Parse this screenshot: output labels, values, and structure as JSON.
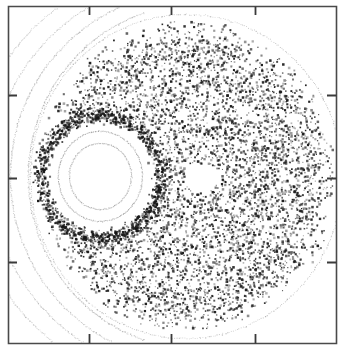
{
  "figure": {
    "title": "",
    "background_color": "#ffffff",
    "width": 346,
    "height": 352
  },
  "chart_data": {
    "type": "scatter",
    "title": "",
    "subtitle": "",
    "xlabel": "",
    "ylabel": "",
    "xlim": [
      0,
      1
    ],
    "ylim": [
      0,
      1
    ],
    "grid": false,
    "legend": null,
    "annotations": [],
    "axes": {
      "frame": {
        "x0": 8,
        "y0": 6,
        "x1": 336,
        "y1": 343,
        "color": "#4a4a4a",
        "line_width": 1.6
      },
      "tick_direction": "in",
      "tick_length": 9,
      "tick_color": "#3a3a3a",
      "tick_line_width": 1.8,
      "ticks_top_x": [
        89,
        171,
        255
      ],
      "ticks_bottom_x": [
        89,
        171,
        255
      ],
      "ticks_left_y": [
        95,
        178,
        262
      ],
      "ticks_right_y": [
        95,
        178,
        262
      ],
      "tick_labels_top": [],
      "tick_labels_bottom": [],
      "tick_labels_left": [],
      "tick_labels_right": []
    },
    "series": [
      {
        "name": "chaotic-sea",
        "kind": "scatter-cloud",
        "point_count": 5200,
        "marker": "square",
        "marker_size": [
          1,
          2.6
        ],
        "color": "#1d1d1d",
        "opacity_range": [
          0.28,
          1.0
        ],
        "region": {
          "shape": "ellipse-minus-island",
          "center": [
            186,
            176
          ],
          "radius_x": 152,
          "radius_y": 158,
          "exclude_island": {
            "center": [
              100,
              176
            ],
            "radius_x": 53,
            "radius_y": 55
          },
          "exclude_void": {
            "center": [
              201,
              177
            ],
            "radius_x": 17,
            "radius_y": 14
          }
        }
      },
      {
        "name": "island-separatrix-halo",
        "kind": "scatter-ring",
        "point_count": 900,
        "color": "#151515",
        "ring": {
          "center": [
            100,
            176
          ],
          "radius_x": 60,
          "radius_y": 62,
          "thickness": 14
        }
      },
      {
        "name": "invariant-circle-outer",
        "kind": "dotted-curve",
        "dot_count": 300,
        "color": "#8a8a8a",
        "ellipse": {
          "center": [
            100,
            176
          ],
          "radius_x": 42,
          "radius_y": 45,
          "rotation": 0
        }
      },
      {
        "name": "invariant-circle-inner",
        "kind": "dotted-curve",
        "dot_count": 260,
        "color": "#9a9a9a",
        "ellipse": {
          "center": [
            100,
            176
          ],
          "radius_x": 31,
          "radius_y": 33,
          "rotation": 0
        }
      },
      {
        "name": "outer-kam-torus-1",
        "kind": "dotted-arc",
        "dot_count": 400,
        "color": "#9e9e9e",
        "ellipse": {
          "center": [
            196,
            176
          ],
          "radius_x": 168,
          "radius_y": 172
        },
        "angle_range_deg": [
          108,
          252
        ]
      },
      {
        "name": "outer-kam-torus-2",
        "kind": "dotted-arc",
        "dot_count": 420,
        "color": "#a6a6a6",
        "ellipse": {
          "center": [
            196,
            176
          ],
          "radius_x": 186,
          "radius_y": 186
        },
        "angle_range_deg": [
          104,
          256
        ]
      },
      {
        "name": "outer-kam-torus-3",
        "kind": "dotted-arc",
        "dot_count": 440,
        "color": "#acacac",
        "ellipse": {
          "center": [
            196,
            176
          ],
          "radius_x": 205,
          "radius_y": 199
        },
        "angle_range_deg": [
          100,
          260
        ]
      },
      {
        "name": "outer-kam-torus-4",
        "kind": "dotted-arc",
        "dot_count": 460,
        "color": "#b4b4b4",
        "ellipse": {
          "center": [
            196,
            176
          ],
          "radius_x": 226,
          "radius_y": 214
        },
        "angle_range_deg": [
          98,
          262
        ]
      },
      {
        "name": "boundary-torus",
        "kind": "dotted-arc",
        "dot_count": 480,
        "color": "#9a9a9a",
        "ellipse": {
          "center": [
            186,
            176
          ],
          "radius_x": 156,
          "radius_y": 162
        },
        "angle_range_deg": [
          -180,
          180
        ]
      }
    ]
  }
}
